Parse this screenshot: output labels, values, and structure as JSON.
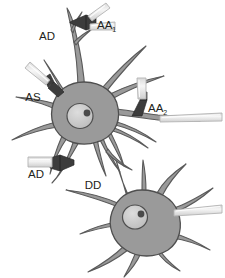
{
  "figure": {
    "domain": "Diagram",
    "background_color": "#ffffff",
    "palette": {
      "soma_fill": "#9a9a9a",
      "soma_stroke": "#4f4f4f",
      "neurite_fill": "#9a9a9a",
      "neurite_stroke": "#5a5a5a",
      "nucleus_fill": "#c9c9c9",
      "nucleus_stroke": "#4f4f4f",
      "nucleolus_fill": "#4a4a4a",
      "pipette_fill": "#ececec",
      "pipette_stroke": "#b9b9b9",
      "terminal_fill": "#3c3c3c",
      "label_color": "#231f20"
    }
  },
  "labels": [
    {
      "id": "ad-top",
      "base": "AD",
      "sub": "",
      "x": 47,
      "y": 40,
      "meaning": "axo-dendritic synapse"
    },
    {
      "id": "aa-1",
      "base": "AA",
      "sub": "1",
      "x": 97,
      "y": 29,
      "meaning": "axo-axonic synapse 1"
    },
    {
      "id": "as",
      "base": "AS",
      "sub": "",
      "x": 33,
      "y": 101,
      "meaning": "axo-somatic synapse"
    },
    {
      "id": "aa-2",
      "base": "AA",
      "sub": "2",
      "x": 148,
      "y": 112,
      "meaning": "axo-axonic synapse 2"
    },
    {
      "id": "ad-bot",
      "base": "AD",
      "sub": "",
      "x": 36,
      "y": 178,
      "meaning": "axo-dendritic synapse"
    },
    {
      "id": "dd",
      "base": "DD",
      "sub": "",
      "x": 93,
      "y": 189,
      "meaning": "dendro-dendritic contact"
    }
  ],
  "cells": [
    {
      "id": "neuron-upper",
      "name": "upper-neuron",
      "soma_center": [
        84,
        111
      ],
      "nucleus_center": [
        80,
        115
      ],
      "nucleolus_center": [
        87,
        113
      ]
    },
    {
      "id": "neuron-lower",
      "name": "lower-neuron",
      "soma_center": [
        143,
        226
      ],
      "nucleus_center": [
        135,
        217
      ],
      "nucleolus_center": [
        142,
        215
      ]
    }
  ],
  "pipettes": [
    {
      "id": "pipette-aa1-a",
      "target_label": "AA1",
      "orientation": "diagonal-upper-right"
    },
    {
      "id": "pipette-aa1-b",
      "target_label": "AA1",
      "orientation": "horizontal-right"
    },
    {
      "id": "pipette-as",
      "target_label": "AS",
      "orientation": "diagonal-upper-left"
    },
    {
      "id": "pipette-aa2",
      "target_label": "AA2",
      "orientation": "vertical-top"
    },
    {
      "id": "pipette-axon",
      "target_label": "axon-upper",
      "orientation": "horizontal-right"
    },
    {
      "id": "pipette-ad",
      "target_label": "AD-bottom",
      "orientation": "horizontal-left"
    },
    {
      "id": "pipette-lower",
      "target_label": "lower-neuron",
      "orientation": "horizontal-right"
    }
  ],
  "terminals": [
    {
      "id": "terminal-aa1",
      "shape": "bowtie"
    },
    {
      "id": "terminal-as",
      "shape": "bowtie"
    },
    {
      "id": "terminal-aa2",
      "shape": "bowtie"
    },
    {
      "id": "terminal-ad",
      "shape": "bowtie"
    }
  ]
}
